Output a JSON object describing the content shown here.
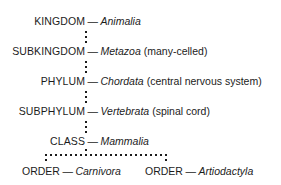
{
  "diagram": {
    "text_color": "#1c1c1c",
    "background_color": "#ffffff",
    "separator": "—",
    "ranks": [
      {
        "rank": "KINGDOM",
        "taxon": "Animalia",
        "annotation": ""
      },
      {
        "rank": "SUBKINGDOM",
        "taxon": "Metazoa",
        "annotation": "(many-celled)"
      },
      {
        "rank": "PHYLUM",
        "taxon": "Chordata",
        "annotation": "(central nervous system)"
      },
      {
        "rank": "SUBPHYLUM",
        "taxon": "Vertebrata",
        "annotation": "(spinal cord)"
      },
      {
        "rank": "CLASS",
        "taxon": "Mammalia",
        "annotation": ""
      }
    ],
    "orders": [
      {
        "rank": "ORDER",
        "taxon": "Carnivora",
        "annotation": ""
      },
      {
        "rank": "ORDER",
        "taxon": "Artiodactyla",
        "annotation": ""
      }
    ]
  }
}
